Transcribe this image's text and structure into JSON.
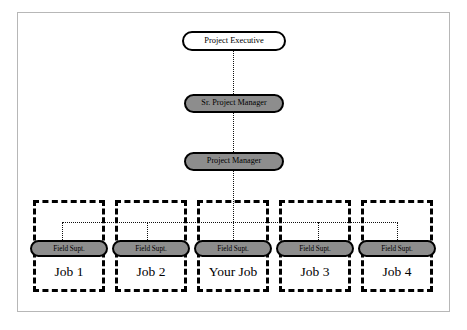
{
  "diagram": {
    "title_text": "",
    "colors": {
      "node_fill_white": "#ffffff",
      "node_fill_gray": "#8d8d8d",
      "border": "#000000",
      "frame": "#b7b7b7",
      "connector": "#111111",
      "background": "#ffffff"
    },
    "nodes": {
      "project_executive": "Project Executive",
      "sr_project_manager": "Sr. Project Manager",
      "project_manager": "Project Manager"
    },
    "field_supt_label": "Field Supt.",
    "jobs": [
      {
        "id": "job-1",
        "label": "Job 1",
        "supervisor": "Field Supt."
      },
      {
        "id": "job-2",
        "label": "Job 2",
        "supervisor": "Field Supt."
      },
      {
        "id": "your-job",
        "label": "Your Job",
        "supervisor": "Field Supt."
      },
      {
        "id": "job-3",
        "label": "Job 3",
        "supervisor": "Field Supt."
      },
      {
        "id": "job-4",
        "label": "Job 4",
        "supervisor": "Field Supt."
      }
    ]
  }
}
